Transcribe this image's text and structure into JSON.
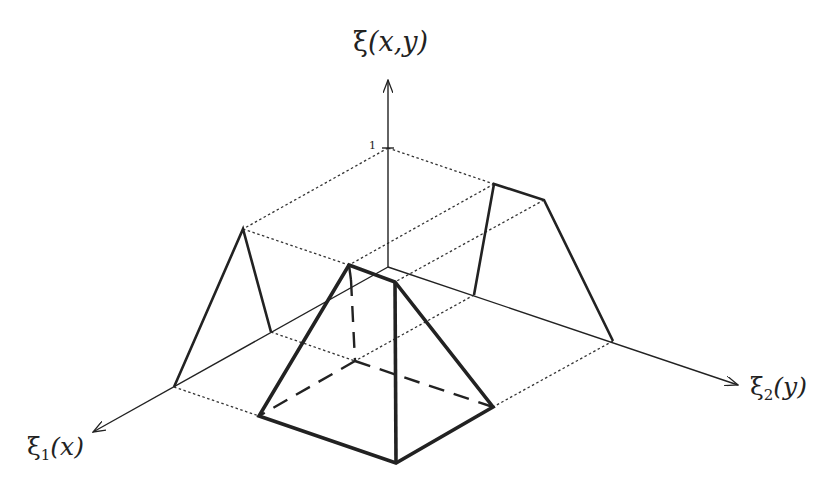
{
  "figure": {
    "axes": {
      "vertical": {
        "symbol": "ξ",
        "args": "(x,y)",
        "label": "ξ(x,y)"
      },
      "x_axis": {
        "symbol": "ξ",
        "subscript": "1",
        "args": "(x)",
        "label": "ξ1(x)"
      },
      "y_axis": {
        "symbol": "ξ",
        "subscript": "2",
        "args": "(y)",
        "label": "ξ2(y)"
      },
      "tick_label": "1"
    },
    "colors": {
      "ink": "#222222",
      "background": "#ffffff"
    },
    "geometry": {
      "origin": [
        388,
        267
      ],
      "z_axis": {
        "from": [
          388,
          267
        ],
        "to": [
          388,
          80
        ]
      },
      "x_axis": {
        "from": [
          388,
          267
        ],
        "to": [
          93,
          432
        ]
      },
      "y_axis": {
        "from": [
          388,
          267
        ],
        "to": [
          738,
          385
        ]
      },
      "tick_one": [
        388,
        148
      ],
      "left_projection": [
        [
          174,
          387
        ],
        [
          243,
          229
        ],
        [
          271,
          332
        ]
      ],
      "right_projection": [
        [
          474,
          295
        ],
        [
          494,
          184
        ],
        [
          544,
          200
        ],
        [
          613,
          341
        ]
      ],
      "pyramid": {
        "top_back": [
          349,
          265
        ],
        "top_front": [
          395,
          282
        ],
        "base_left": [
          259,
          416
        ],
        "base_front": [
          396,
          463
        ],
        "base_right": [
          493,
          407
        ],
        "base_back": [
          355,
          361
        ]
      }
    }
  }
}
